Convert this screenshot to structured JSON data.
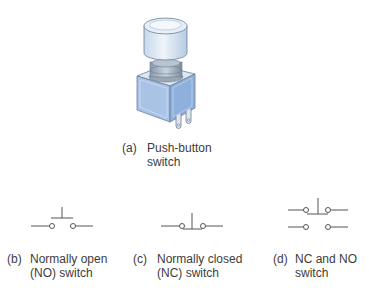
{
  "figures": [
    {
      "id": "a",
      "label": "(a)",
      "lines": [
        "Push-button",
        "switch"
      ],
      "kind": "push-button-illustration"
    },
    {
      "id": "b",
      "label": "(b)",
      "lines": [
        "Normally open",
        "(NO) switch"
      ],
      "kind": "no-switch-symbol"
    },
    {
      "id": "c",
      "label": "(c)",
      "lines": [
        "Normally closed",
        "(NC) switch"
      ],
      "kind": "nc-switch-symbol"
    },
    {
      "id": "d",
      "label": "(d)",
      "lines": [
        "NC and NO",
        "switch"
      ],
      "kind": "nc-no-switch-symbol"
    }
  ],
  "colors": {
    "line": "#555555",
    "cap_light": "#e3edf6",
    "cap_mid": "#c3d6e8",
    "box_front": "#a9c3e6",
    "box_side": "#8fb0dc",
    "outline": "#6a7f99"
  }
}
